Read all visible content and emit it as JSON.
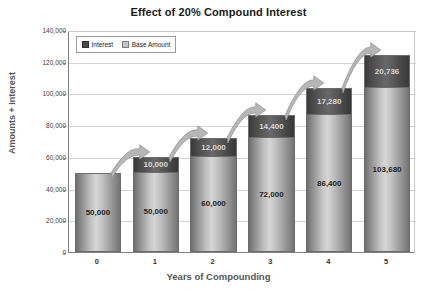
{
  "chart_data": {
    "type": "bar",
    "title": "Effect of 20% Compound Interest",
    "xlabel": "Years of Compounding",
    "ylabel": "Amounts + Interest",
    "categories": [
      "0",
      "1",
      "2",
      "3",
      "4",
      "5"
    ],
    "ylim": [
      0,
      140000
    ],
    "ytick_labels": [
      "140,000",
      "120,000",
      "100,000",
      "80,000",
      "60,000",
      "40,000",
      "20,000",
      "0"
    ],
    "ytick_values": [
      140000,
      120000,
      100000,
      80000,
      60000,
      40000,
      20000,
      0
    ],
    "grid": true,
    "stacked": true,
    "legend_position": "top-left-inside",
    "series": [
      {
        "name": "Interest",
        "color": "#4a4a4a",
        "values": [
          0,
          10000,
          12000,
          14400,
          17280,
          20736
        ],
        "labels": [
          "",
          "10,000",
          "12,000",
          "14,400",
          "17,280",
          "20,736"
        ]
      },
      {
        "name": "Base Amount",
        "color": "#c4c4c4",
        "values": [
          50000,
          50000,
          60000,
          72000,
          86400,
          103680
        ],
        "labels": [
          "50,000",
          "50,000",
          "60,000",
          "72,000",
          "86,400",
          "103,680"
        ]
      }
    ],
    "totals": [
      50000,
      60000,
      72000,
      86400,
      103680,
      124416
    ],
    "annotations": [
      {
        "type": "curved-arrow",
        "from_category": "0",
        "to_category": "1"
      },
      {
        "type": "curved-arrow",
        "from_category": "1",
        "to_category": "2"
      },
      {
        "type": "curved-arrow",
        "from_category": "2",
        "to_category": "3"
      },
      {
        "type": "curved-arrow",
        "from_category": "3",
        "to_category": "4"
      },
      {
        "type": "curved-arrow",
        "from_category": "4",
        "to_category": "5"
      }
    ]
  },
  "legend": {
    "items": [
      {
        "label": "Interest"
      },
      {
        "label": "Base Amount"
      }
    ]
  }
}
